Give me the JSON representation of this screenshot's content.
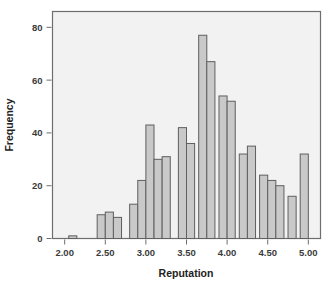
{
  "chart_data": {
    "type": "bar",
    "title": "",
    "xlabel": "Reputation",
    "ylabel": "Frequency",
    "xlim": [
      1.85,
      5.15
    ],
    "ylim": [
      0,
      86
    ],
    "bin_width": 0.1,
    "grid": false,
    "legend": null,
    "xticks": [
      2.0,
      2.5,
      3.0,
      3.5,
      4.0,
      4.5,
      5.0
    ],
    "xticklabels": [
      "2.00",
      "2.50",
      "3.00",
      "3.50",
      "4.00",
      "4.50",
      "5.00"
    ],
    "yticks": [
      0,
      20,
      40,
      60,
      80
    ],
    "yticklabels": [
      "0",
      "20",
      "40",
      "60",
      "80"
    ],
    "bar_fill": "#c9c9c9",
    "bar_edge": "#5f5f5f",
    "plot_background": "#f2f2f2",
    "bins": [
      {
        "left": 2.05,
        "right": 2.15,
        "value": 1
      },
      {
        "left": 2.4,
        "right": 2.5,
        "value": 9
      },
      {
        "left": 2.5,
        "right": 2.6,
        "value": 10
      },
      {
        "left": 2.6,
        "right": 2.7,
        "value": 8
      },
      {
        "left": 2.8,
        "right": 2.9,
        "value": 13
      },
      {
        "left": 2.9,
        "right": 3.0,
        "value": 22
      },
      {
        "left": 3.0,
        "right": 3.1,
        "value": 43
      },
      {
        "left": 3.1,
        "right": 3.2,
        "value": 30
      },
      {
        "left": 3.2,
        "right": 3.3,
        "value": 31
      },
      {
        "left": 3.4,
        "right": 3.5,
        "value": 42
      },
      {
        "left": 3.5,
        "right": 3.6,
        "value": 36
      },
      {
        "left": 3.65,
        "right": 3.75,
        "value": 77
      },
      {
        "left": 3.75,
        "right": 3.85,
        "value": 67
      },
      {
        "left": 3.9,
        "right": 4.0,
        "value": 54
      },
      {
        "left": 4.0,
        "right": 4.1,
        "value": 52
      },
      {
        "left": 4.15,
        "right": 4.25,
        "value": 32
      },
      {
        "left": 4.25,
        "right": 4.35,
        "value": 35
      },
      {
        "left": 4.4,
        "right": 4.5,
        "value": 24
      },
      {
        "left": 4.5,
        "right": 4.6,
        "value": 22
      },
      {
        "left": 4.6,
        "right": 4.7,
        "value": 20
      },
      {
        "left": 4.75,
        "right": 4.85,
        "value": 16
      },
      {
        "left": 4.9,
        "right": 5.0,
        "value": 32
      }
    ]
  }
}
